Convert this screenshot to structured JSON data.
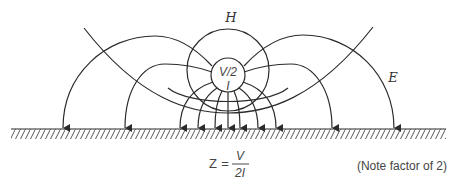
{
  "diagram": {
    "labels": {
      "magnetic_field": "H",
      "electric_field": "E",
      "source_voltage": "V/2",
      "source_current": "I"
    },
    "equation": {
      "lhs": "Z",
      "equals": "=",
      "numerator": "V",
      "denominator": "2I"
    },
    "note": "(Note factor of 2)",
    "colors": {
      "stroke": "#2b2b2b",
      "background": "#ffffff"
    },
    "ground_arrows_x": [
      63,
      125,
      180,
      198,
      215,
      228,
      240,
      258,
      276,
      332,
      394
    ]
  }
}
